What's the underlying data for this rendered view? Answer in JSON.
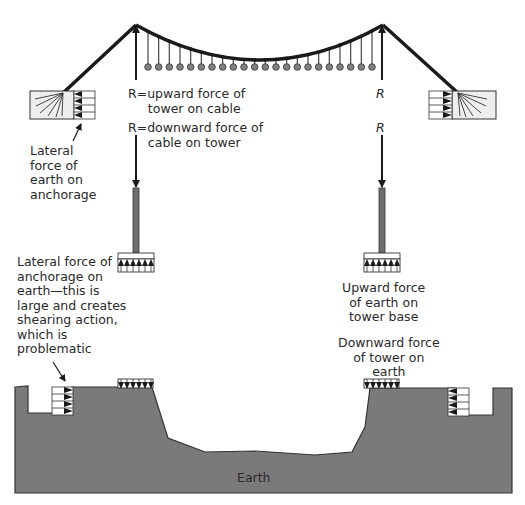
{
  "diagram": {
    "labels": {
      "r_upward": "R=upward force of\n     tower on cable",
      "r_downward": "R=downward force of\n     cable on tower",
      "r_right_up": "R",
      "r_right_down": "R",
      "lateral_earth_on_anchorage": "Lateral\nforce of\nearth on\nanchorage",
      "lateral_anchorage_on_earth": "Lateral force of\nanchorage on\nearth—this is\nlarge and creates\nshearing action,\nwhich is\nproblematic",
      "upward_earth_on_base": "Upward force\nof earth on\ntower base",
      "downward_tower_on_earth": "Downward force\nof tower on\nearth",
      "earth": "Earth"
    },
    "colors": {
      "cable": "#1a1a1a",
      "ground": "#7a7a7a",
      "ground_edge": "#333333",
      "hanger_ball": "#7f7f7f",
      "tower": "#6e6e6e",
      "anchor_block": "#eeeeee"
    },
    "hanger_count": 22
  }
}
